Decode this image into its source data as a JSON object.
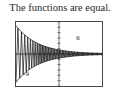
{
  "caption": {
    "text": "The functions are equal."
  },
  "graph": {
    "axis_labels": {
      "x_min": "-9",
      "x_max": "9",
      "y_max": "6",
      "y_min": "-6"
    },
    "colors": {
      "frame": "#4a4a4a",
      "axis": "#333333",
      "curve": "#111111",
      "background": "#ffffff"
    }
  },
  "chart_data": {
    "type": "line",
    "title": "The functions are equal.",
    "xlabel": "",
    "ylabel": "",
    "xlim": [
      -9,
      9
    ],
    "ylim": [
      -6,
      6
    ],
    "grid": false,
    "legend": "none",
    "axes": {
      "x_axis_at_y": 0,
      "y_axis_at_x": 0,
      "x_tick_step": 1,
      "y_tick_step": 1,
      "tick_marks": true
    },
    "annotations": [
      "Damped oscillation: amplitude large at x = -9 and decaying toward 0 as x increases to 9",
      "Upper and lower envelope curves drawn around the oscillation",
      "Two overlapping functions plotted identically"
    ],
    "series": [
      {
        "name": "damped-oscillation",
        "x": [
          -9.0,
          -8.6,
          -8.2,
          -7.8,
          -7.4,
          -7.0,
          -6.6,
          -6.2,
          -5.8,
          -5.4,
          -5.0,
          -4.6,
          -4.2,
          -3.8,
          -3.4,
          -3.0,
          -2.6,
          -2.2,
          -1.8,
          -1.4,
          -1.0,
          -0.6,
          -0.2,
          0.2,
          0.6,
          1.0,
          1.4,
          1.8,
          2.2,
          2.6,
          3.0,
          3.4,
          3.8,
          4.2,
          4.6,
          5.0,
          5.4,
          5.8,
          6.2,
          6.6,
          7.0,
          7.4,
          7.8,
          8.2,
          8.6,
          9.0
        ],
        "y": [
          -5.2,
          5.0,
          -4.6,
          4.4,
          -4.1,
          3.9,
          -3.6,
          3.4,
          -3.1,
          2.9,
          -2.7,
          2.5,
          -2.3,
          2.1,
          -1.9,
          1.8,
          -1.6,
          1.5,
          -1.3,
          1.2,
          -1.1,
          1.0,
          -0.9,
          0.85,
          -0.78,
          0.72,
          -0.66,
          0.6,
          -0.55,
          0.5,
          -0.46,
          0.42,
          -0.38,
          0.35,
          -0.32,
          0.29,
          -0.26,
          0.24,
          -0.22,
          0.2,
          -0.18,
          0.16,
          -0.15,
          0.13,
          -0.12,
          0.11
        ]
      },
      {
        "name": "upper-envelope",
        "x": [
          -9,
          -7,
          -5,
          -3,
          -1,
          1,
          3,
          5,
          7,
          9
        ],
        "y": [
          5.3,
          4.0,
          2.9,
          1.9,
          1.1,
          0.72,
          0.46,
          0.29,
          0.18,
          0.11
        ]
      },
      {
        "name": "lower-envelope",
        "x": [
          -9,
          -7,
          -5,
          -3,
          -1,
          1,
          3,
          5,
          7,
          9
        ],
        "y": [
          -5.3,
          -4.0,
          -2.9,
          -1.9,
          -1.1,
          -0.72,
          -0.46,
          -0.29,
          -0.18,
          -0.11
        ]
      }
    ]
  }
}
